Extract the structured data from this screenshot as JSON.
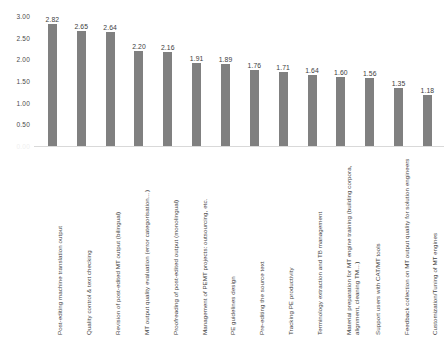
{
  "chart_data": {
    "type": "bar",
    "title": "",
    "subtitle": "",
    "xlabel": "",
    "ylabel": "",
    "ylim": [
      0.0,
      3.0
    ],
    "ytick_labels": [
      "3.00",
      "2.50",
      "2.00",
      "1.50",
      "1.00",
      "0.50",
      "0.00"
    ],
    "ytick_values": [
      3.0,
      2.5,
      2.0,
      1.5,
      1.0,
      0.5,
      0.0
    ],
    "grid": false,
    "legend": "none",
    "bar_color": "#808080",
    "categories": [
      "Post-editing machine translation output",
      "Quality control & text checking",
      "Revision of post-edited MT output (bilingual)",
      "MT output quality evaluation (error categorisation…)",
      "Proofreading of post-edited output (monolingual)",
      "Management of PEMT projects: outsourcing, etc.",
      "PE guidelines design",
      "Pre-editing the source text",
      "Tracking PE productivity",
      "Terminology extraction and TB management",
      "Material preparation for MT engine training (building corpora, alignment, cleaning TM…)",
      "Support users with CAT/MT tools",
      "Feedback collection on MT output quality for solution engineers",
      "Customization/Tuning of MT engines"
    ],
    "values": [
      2.82,
      2.65,
      2.64,
      2.2,
      2.16,
      1.91,
      1.89,
      1.76,
      1.71,
      1.64,
      1.6,
      1.56,
      1.35,
      1.18
    ],
    "value_labels": [
      "2.82",
      "2.65",
      "2.64",
      "2.20",
      "2.16",
      "1.91",
      "1.89",
      "1.76",
      "1.71",
      "1.64",
      "1.60",
      "1.56",
      "1.35",
      "1.18"
    ]
  }
}
